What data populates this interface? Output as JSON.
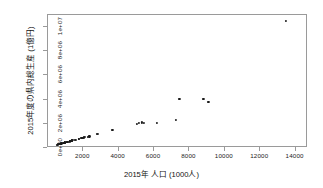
{
  "chart_data": {
    "type": "scatter",
    "title": "",
    "xlabel": "2015年 人口 (1000人)",
    "ylabel": "2015年度の県内総生産 (1億円)",
    "xlim": [
      0,
      14700
    ],
    "ylim": [
      0,
      11000000
    ],
    "xticks": [
      2000,
      4000,
      6000,
      8000,
      10000,
      12000,
      14000
    ],
    "xticklabels": [
      "2000",
      "4000",
      "6000",
      "8000",
      "10000",
      "12000",
      "14000"
    ],
    "yticks": [
      0,
      2000000,
      4000000,
      6000000,
      8000000,
      10000000
    ],
    "yticklabels": [
      "0e+00",
      "2e+06",
      "4e+06",
      "6e+06",
      "8e+06",
      "1e+07"
    ],
    "grid": false,
    "legend": null,
    "marker": "filled-circle",
    "marker_color": "#1a1a1a",
    "points": [
      {
        "x": 573,
        "y": 198000
      },
      {
        "x": 603,
        "y": 208000
      },
      {
        "x": 700,
        "y": 240000
      },
      {
        "x": 717,
        "y": 250000
      },
      {
        "x": 742,
        "y": 263000
      },
      {
        "x": 757,
        "y": 268000
      },
      {
        "x": 786,
        "y": 278000
      },
      {
        "x": 790,
        "y": 285000
      },
      {
        "x": 810,
        "y": 290000
      },
      {
        "x": 841,
        "y": 310000
      },
      {
        "x": 956,
        "y": 345000
      },
      {
        "x": 974,
        "y": 355000
      },
      {
        "x": 976,
        "y": 360000
      },
      {
        "x": 989,
        "y": 372000
      },
      {
        "x": 1008,
        "y": 380000
      },
      {
        "x": 1023,
        "y": 385000
      },
      {
        "x": 1124,
        "y": 420000
      },
      {
        "x": 1154,
        "y": 430000
      },
      {
        "x": 1166,
        "y": 445000
      },
      {
        "x": 1280,
        "y": 470000
      },
      {
        "x": 1308,
        "y": 480000
      },
      {
        "x": 1364,
        "y": 500000
      },
      {
        "x": 1377,
        "y": 515000
      },
      {
        "x": 1385,
        "y": 520000
      },
      {
        "x": 1413,
        "y": 540000
      },
      {
        "x": 1421,
        "y": 545000
      },
      {
        "x": 1448,
        "y": 560000
      },
      {
        "x": 1575,
        "y": 600000
      },
      {
        "x": 1648,
        "y": 620000
      },
      {
        "x": 1786,
        "y": 690000
      },
      {
        "x": 1816,
        "y": 700000
      },
      {
        "x": 1934,
        "y": 740000
      },
      {
        "x": 1967,
        "y": 760000
      },
      {
        "x": 1976,
        "y": 775000
      },
      {
        "x": 2041,
        "y": 780000
      },
      {
        "x": 2100,
        "y": 800000
      },
      {
        "x": 2166,
        "y": 830000
      },
      {
        "x": 2334,
        "y": 850000
      },
      {
        "x": 2398,
        "y": 870000
      },
      {
        "x": 2843,
        "y": 1060000
      },
      {
        "x": 2891,
        "y": 1100000
      },
      {
        "x": 3700,
        "y": 1390000
      },
      {
        "x": 5102,
        "y": 1940000
      },
      {
        "x": 5184,
        "y": 1960000
      },
      {
        "x": 5382,
        "y": 2030000
      },
      {
        "x": 5484,
        "y": 2010000
      },
      {
        "x": 6223,
        "y": 2020000
      },
      {
        "x": 7283,
        "y": 2250000
      },
      {
        "x": 7483,
        "y": 3960000
      },
      {
        "x": 8839,
        "y": 3960000
      },
      {
        "x": 9126,
        "y": 3760000
      },
      {
        "x": 13515,
        "y": 10400000
      }
    ]
  }
}
